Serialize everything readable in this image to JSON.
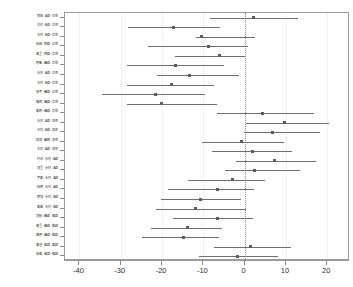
{
  "chart_data": {
    "type": "scatter",
    "subtype": "forest-plot-confidence-intervals",
    "title": "",
    "xlabel": "",
    "ylabel": "",
    "xlim": [
      -43.5,
      25.5
    ],
    "ylim_rows": 26,
    "grid": false,
    "reference_line": 0,
    "reference_line_style": "dotted",
    "legend": null,
    "xticks": [
      -40,
      -30,
      -20,
      -10,
      0,
      10,
      20
    ],
    "xticklabels": [
      "-40",
      "-30",
      "-20",
      "-10",
      "0",
      "10",
      "20"
    ],
    "categories": [
      "幸田 : A群 : 女性",
      "木村 : B群 : 女性",
      "水村 : B群 : 女性",
      "続田 : 明群 : 女性",
      "島里 : 明群 : 女性",
      "明島 : 昌群 : 女性",
      "水村 : A群 : 女性",
      "水村 : B群 : 女性",
      "続宇 : 昌群 : 女性",
      "島明 : 昌群 : 女性",
      "島明 : 昌群 : 女性",
      "水村 : A群 : 男性",
      "水村 : B群 : 男性",
      "続羽 : 昌群 : 男性",
      "木村 : A群 : 男性",
      "村日 : 水村 : A群",
      "羽里 : 水村 : A群",
      "宇島 : 水村 : A群",
      "続明 : 水村 : A群",
      "明羽 : 水村 : B群",
      "島島 : 水村 : B群",
      "羽続 : 昌群 : 島群",
      "島里 : 昌群 : 島群",
      "島明 : 昌群 : 島群",
      "島羽 : 島群 : 島群",
      "続島 : 島群 : 島群"
    ],
    "series": [
      {
        "name": "effect-with-ci",
        "points": [
          {
            "center": 2.2,
            "low": -8.4,
            "high": 12.9
          },
          {
            "center": -17.2,
            "low": -28.2,
            "high": -5.9
          },
          {
            "center": -10.5,
            "low": -11.8,
            "high": 2.4
          },
          {
            "center": -8.7,
            "low": -23.4,
            "high": 0.9
          },
          {
            "center": -6.0,
            "low": -16.8,
            "high": 0.2
          },
          {
            "center": -16.8,
            "low": -28.6,
            "high": -4.9
          },
          {
            "center": -13.3,
            "low": -21.3,
            "high": -1.3
          },
          {
            "center": -17.6,
            "low": -28.6,
            "high": -7.5
          },
          {
            "center": -21.5,
            "low": -34.5,
            "high": -9.6
          },
          {
            "center": -20.2,
            "low": -28.4,
            "high": -6.6
          },
          {
            "center": 4.2,
            "low": -6.8,
            "high": 16.9
          },
          {
            "center": 9.6,
            "low": 0.4,
            "high": 20.4
          },
          {
            "center": 6.8,
            "low": -0.2,
            "high": 18.3
          },
          {
            "center": -0.7,
            "low": -10.4,
            "high": 9.5
          },
          {
            "center": 1.8,
            "low": -7.8,
            "high": 11.5
          },
          {
            "center": 7.2,
            "low": -2.0,
            "high": 17.2
          },
          {
            "center": 2.4,
            "low": -4.8,
            "high": 13.4
          },
          {
            "center": -2.9,
            "low": -13.8,
            "high": 4.9
          },
          {
            "center": -6.7,
            "low": -18.5,
            "high": 2.3
          },
          {
            "center": -10.7,
            "low": -20.2,
            "high": -0.9
          },
          {
            "center": -12.0,
            "low": -21.5,
            "high": 0.3
          },
          {
            "center": -6.6,
            "low": -17.4,
            "high": 1.9
          },
          {
            "center": -13.9,
            "low": -22.8,
            "high": -5.4
          },
          {
            "center": -14.9,
            "low": -24.8,
            "high": -6.2
          },
          {
            "center": 1.3,
            "low": -7.5,
            "high": 11.1
          },
          {
            "center": -1.8,
            "low": -11.0,
            "high": 8.0
          }
        ]
      }
    ],
    "colors": {
      "segment": "#6f6f6f",
      "marker": "#5d5d5d",
      "frame": "#9a9a9a",
      "reference": "#8f8f8f",
      "text": "#2b2b2b"
    }
  }
}
